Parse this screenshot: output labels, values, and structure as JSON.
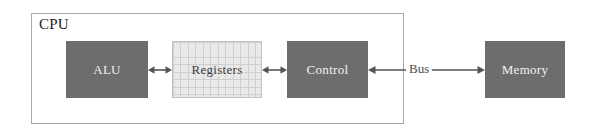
{
  "diagram": {
    "background_color": "#ffffff",
    "enclosure": {
      "label": "CPU",
      "border_color": "#a8a8a8",
      "text_color": "#222222"
    },
    "blocks": [
      {
        "id": "alu",
        "label": "ALU",
        "fill": "#6d6d6d",
        "text_color": "#f2f2f2",
        "style": "solid",
        "inside_cpu": true
      },
      {
        "id": "registers",
        "label": "Registers",
        "fill": "#e9e9e9",
        "grid_color": "#cfcfcf",
        "text_color": "#3a3a3a",
        "style": "grid",
        "inside_cpu": true
      },
      {
        "id": "control",
        "label": "Control",
        "fill": "#6d6d6d",
        "text_color": "#f2f2f2",
        "style": "solid",
        "inside_cpu": true
      },
      {
        "id": "memory",
        "label": "Memory",
        "fill": "#6d6d6d",
        "text_color": "#f2f2f2",
        "style": "solid",
        "inside_cpu": false
      }
    ],
    "connectors": [
      {
        "id": "alu-registers",
        "from": "alu",
        "to": "registers",
        "label": "",
        "arrowheads": "both",
        "color": "#555555"
      },
      {
        "id": "registers-control",
        "from": "registers",
        "to": "control",
        "label": "",
        "arrowheads": "both",
        "color": "#555555"
      },
      {
        "id": "bus",
        "from": "control",
        "to": "memory",
        "label": "Bus",
        "arrowheads": "both",
        "color": "#555555",
        "label_color": "#4a4a4a"
      }
    ]
  }
}
